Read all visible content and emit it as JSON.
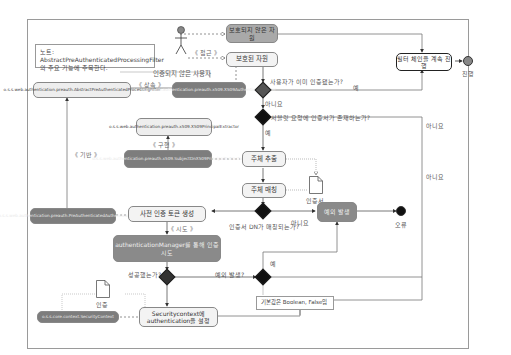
{
  "diagram": {
    "note": "노트: AbstractPreAuthenticatedProcessingFilter의 주요 기능에 주목한다.",
    "actor": {
      "label": "인증되지 않은 사용자"
    },
    "stereotypes": {
      "access": "《 접근 》",
      "inherit": "《 상속 》",
      "implement": "《 구현 》",
      "base": "《 기반 》",
      "attempt": "《 시도 》"
    },
    "nodes": {
      "unprotected_resource": "보호되지 않은 자원",
      "protected_resource": "보호된 자원",
      "abstract_filter": "o.s.s.web.authentication.preauth.AbstractPreAuthenticatedProcessingFilter",
      "x509_filter": "o.s.s.web.authentication.preauth.x509.X509AuthenticationFilter",
      "x509_principal_extractor": "o.s.s.web.authentication.preauth.x509.X509PrincipalExtractor",
      "subject_dn_extractor": "o.s.s.web.authentication.preauth.x509.SubjectDnX509PrincipalExtractor",
      "extract_subject": "주체 추출",
      "match_subject": "주체 매칭",
      "preauth_token_class": "o.s.s.web.authentication.preauth.PreAuthenticatedAuthenticationToken",
      "create_preauth_token": "사전 인증 토큰 생성",
      "auth_manager_attempt": "authenticationManager를 통해 인증 시도",
      "exception_raised": "예외 발생",
      "continue_filter_chain": "필터 체인을 계속 진행",
      "security_context_class": "o.s.s.core.context.SecurityContext",
      "set_authentication": "Securitycontext에 authentication을 설정"
    },
    "documents": {
      "certificate": "인증서",
      "authentication": "인증"
    },
    "decisions": {
      "already_authenticated": "사용자가 이미 인증됐는가?",
      "cert_exists": "서블릿 요청에 인증서가 존재하는가?",
      "dn_matches": "인증서 DN가 매칭되는가?",
      "succeeded": "성공했는가?",
      "exception_occurred": "예외 발생?"
    },
    "edge_labels": {
      "yes": "예",
      "no": "아니요"
    },
    "endpoints": {
      "proceed": "진행",
      "error": "오류"
    },
    "default_note": "기본값은 Boolean, False임"
  }
}
